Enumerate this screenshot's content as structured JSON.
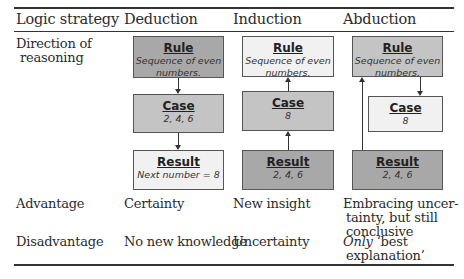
{
  "table": {
    "headers": [
      "Logic strategy",
      "Deduction",
      "Induction",
      "Abduction"
    ],
    "rows": {
      "direction": {
        "label_line1": "Direction of",
        "label_line2": "reasoning"
      },
      "advantage": {
        "label": "Advantage",
        "deduction": "Certainty",
        "induction": "New insight",
        "abduction_line1": "Embracing uncer-",
        "abduction_line2": "tainty, but still",
        "abduction_line3": "conclusive"
      },
      "disadvantage": {
        "label": "Disadvantage",
        "deduction": "No new knowledge",
        "induction": "Uncertainty",
        "abduction_italic": "Only",
        "abduction_line1_rest": " ‘best",
        "abduction_line2": "explanation’"
      }
    }
  },
  "diagrams": {
    "deduction": {
      "rule": {
        "title": "Rule",
        "sub1": "Sequence of even",
        "sub2": "numbers."
      },
      "case": {
        "title": "Case",
        "sub": "2, 4, 6"
      },
      "result": {
        "title": "Result",
        "sub": "Next number = 8"
      },
      "flow": "Rule -> Case -> Result"
    },
    "induction": {
      "rule": {
        "title": "Rule",
        "sub1": "Sequence of even",
        "sub2": "numbers."
      },
      "case": {
        "title": "Case",
        "sub": "8"
      },
      "result": {
        "title": "Result",
        "sub": "2, 4, 6"
      },
      "flow": "Result -> Case -> Rule"
    },
    "abduction": {
      "rule": {
        "title": "Rule",
        "sub1": "Sequence of even",
        "sub2": "numbers."
      },
      "case": {
        "title": "Case",
        "sub": "8"
      },
      "result": {
        "title": "Result",
        "sub": "2, 4, 6"
      },
      "flow": "Result -> Rule -> Case"
    }
  },
  "colors": {
    "dark_box": "#a8a8a8",
    "mid_box": "#c4c4c4",
    "light_box": "#f1f1f1"
  }
}
